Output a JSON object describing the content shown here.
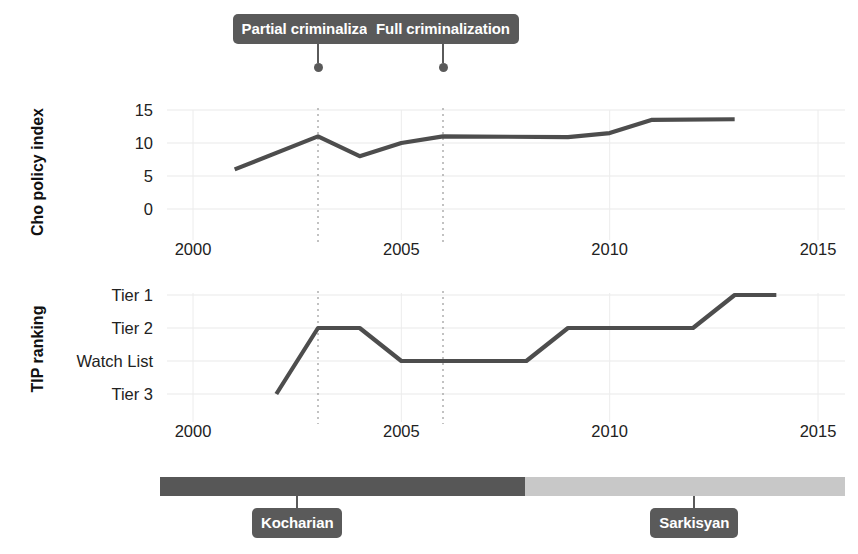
{
  "chart_data": [
    {
      "type": "line",
      "title": "",
      "ylabel": "Cho policy index",
      "xlabel": "",
      "xlim": [
        2000,
        2015
      ],
      "ylim": [
        -1.5,
        16.5
      ],
      "yticks": [
        15,
        10,
        5,
        0
      ],
      "ytick_labels": [
        "15",
        "10",
        "5",
        "0"
      ],
      "xticks": [
        2000,
        2005,
        2010,
        2015
      ],
      "xtick_labels": [
        "2000",
        "2005",
        "2010",
        "2015"
      ],
      "grid": true,
      "series": [
        {
          "name": "Cho policy index",
          "x": [
            2001,
            2003,
            2004,
            2005,
            2006,
            2009,
            2010,
            2011,
            2013
          ],
          "values": [
            6.0,
            11.0,
            8.0,
            10.0,
            11.0,
            10.9,
            11.5,
            13.5,
            13.6
          ]
        }
      ]
    },
    {
      "type": "line",
      "title": "",
      "ylabel": "TIP ranking",
      "xlabel": "",
      "xlim": [
        2000,
        2015
      ],
      "ylim": [
        0.4,
        4.6
      ],
      "yticks": [
        1,
        2,
        3,
        4
      ],
      "ytick_labels": [
        "Tier 1",
        "Tier 2",
        "Watch List",
        "Tier 3"
      ],
      "xticks": [
        2000,
        2005,
        2010,
        2015
      ],
      "xtick_labels": [
        "2000",
        "2005",
        "2010",
        "2015"
      ],
      "grid": true,
      "series": [
        {
          "name": "TIP ranking",
          "x": [
            2002,
            2003,
            2004,
            2005,
            2008,
            2009,
            2012,
            2013,
            2014
          ],
          "values": [
            "Tier 3",
            "Tier 2",
            "Tier 2",
            "Watch List",
            "Watch List",
            "Tier 2",
            "Tier 2",
            "Tier 1",
            "Tier 1"
          ],
          "numeric_values": [
            4,
            2,
            2,
            3,
            3,
            2,
            2,
            1,
            1
          ]
        }
      ]
    }
  ],
  "annotations": [
    {
      "label": "Partial criminalization",
      "year": 2003
    },
    {
      "label": "Full criminalization",
      "year": 2006
    }
  ],
  "timeline": {
    "segments": [
      {
        "label": "Kocharian",
        "start": 2000,
        "end": 2008,
        "color": "#575757",
        "label_year": 2003
      },
      {
        "label": "Sarkisyan",
        "start": 2008,
        "end": 2015,
        "color": "#c8c8c8",
        "label_year": 2011.7
      }
    ]
  },
  "colors": {
    "series_line": "#4d4d4d",
    "callout_bg": "#5a5a5a",
    "callout_text": "#ffffff",
    "grid": "#e9e9e9",
    "marker_dotted": "#9a9a9a"
  }
}
